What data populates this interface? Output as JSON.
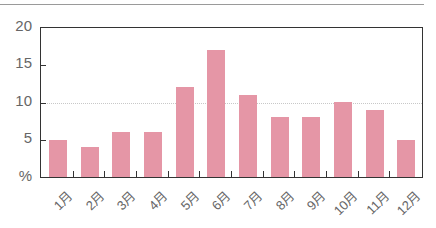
{
  "chart_data": {
    "type": "bar",
    "title": "",
    "xlabel": "",
    "ylabel": "%",
    "categories": [
      "1月",
      "2月",
      "3月",
      "4月",
      "5月",
      "6月",
      "7月",
      "8月",
      "9月",
      "10月",
      "11月",
      "12月"
    ],
    "values": [
      5,
      4,
      6,
      6,
      12,
      17,
      11,
      8,
      8,
      10,
      9,
      5
    ],
    "ylim": [
      0,
      20
    ],
    "yticks": [
      "%",
      "5",
      "10",
      "15",
      "20"
    ],
    "grid": "dotted line at 10",
    "bar_color": "#e596a6",
    "legend": null
  }
}
